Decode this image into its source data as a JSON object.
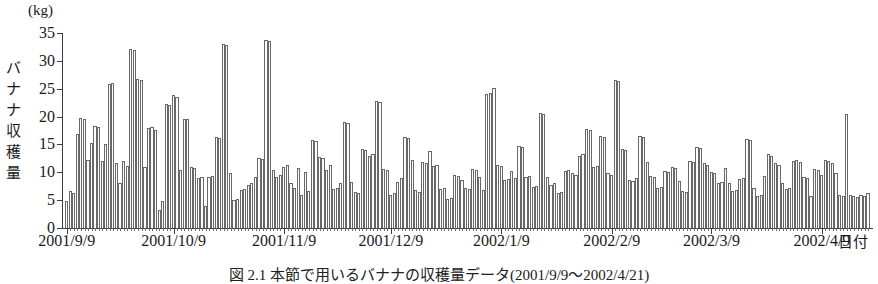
{
  "figure": {
    "unit_label": "(kg)",
    "y_axis_title_chars": [
      "バ",
      "ナ",
      "ナ",
      "収",
      "穫",
      "量"
    ],
    "x_axis_title": "日付",
    "caption": "図 2.1  本節で用いるバナナの収穫量データ(2001/9/9〜2002/4/21)"
  },
  "chart_data": {
    "type": "bar",
    "title": "",
    "xlabel": "日付",
    "ylabel": "バナナ収穫量",
    "unit": "kg",
    "ylim": [
      0,
      35
    ],
    "yticks": [
      0,
      5,
      10,
      15,
      20,
      25,
      30,
      35
    ],
    "grid": false,
    "legend": null,
    "x_tick_labels": [
      "2001/9/9",
      "2001/10/9",
      "2001/11/9",
      "2001/12/9",
      "2002/1/9",
      "2002/2/9",
      "2002/3/9",
      "2002/4/9"
    ],
    "x_tick_indices": [
      0,
      30,
      61,
      91,
      122,
      153,
      181,
      212
    ],
    "n_points": 226,
    "start_date": "2001/9/9",
    "values": [
      4.8,
      6.6,
      6.2,
      16.8,
      19.8,
      19.6,
      12.2,
      15.2,
      18.4,
      18.2,
      12.0,
      15.0,
      25.8,
      26.0,
      11.6,
      8.0,
      12.0,
      11.2,
      32.2,
      32.0,
      26.8,
      26.6,
      11.0,
      18.0,
      18.2,
      17.6,
      3.2,
      4.8,
      22.2,
      22.0,
      23.8,
      23.6,
      10.4,
      19.6,
      19.6,
      11.0,
      10.8,
      9.0,
      9.2,
      4.0,
      9.2,
      9.4,
      16.4,
      16.2,
      33.0,
      32.8,
      9.8,
      5.0,
      5.2,
      6.8,
      7.0,
      7.8,
      8.0,
      9.2,
      12.6,
      12.4,
      33.8,
      33.6,
      10.4,
      9.2,
      9.6,
      11.0,
      11.4,
      8.0,
      7.2,
      10.8,
      6.0,
      10.0,
      6.6,
      15.8,
      15.6,
      12.8,
      12.6,
      10.4,
      11.4,
      7.0,
      7.2,
      8.0,
      19.0,
      18.8,
      8.2,
      6.4,
      6.2,
      14.2,
      14.0,
      13.0,
      13.2,
      22.8,
      22.6,
      10.6,
      10.4,
      6.0,
      6.2,
      8.2,
      9.0,
      16.4,
      16.2,
      12.2,
      6.8,
      6.4,
      11.8,
      11.6,
      13.8,
      11.2,
      11.4,
      7.0,
      7.2,
      5.2,
      5.4,
      9.6,
      9.4,
      8.6,
      7.2,
      7.0,
      10.6,
      10.4,
      9.2,
      6.8,
      24.0,
      24.2,
      25.2,
      11.4,
      11.2,
      8.6,
      8.8,
      10.2,
      9.0,
      14.8,
      14.6,
      9.2,
      9.4,
      7.4,
      7.6,
      20.6,
      20.4,
      9.2,
      7.8,
      8.0,
      6.2,
      6.4,
      10.2,
      10.4,
      9.8,
      9.6,
      13.0,
      13.2,
      17.8,
      17.6,
      11.0,
      11.2,
      16.6,
      16.4,
      9.8,
      9.6,
      26.6,
      26.4,
      14.2,
      14.0,
      8.6,
      8.4,
      9.0,
      16.6,
      16.4,
      11.8,
      9.4,
      9.2,
      7.2,
      7.4,
      10.2,
      10.0,
      11.0,
      10.8,
      8.4,
      6.6,
      6.4,
      12.0,
      11.8,
      14.6,
      14.4,
      11.6,
      11.4,
      10.0,
      9.8,
      8.0,
      8.2,
      10.8,
      8.0,
      6.6,
      6.8,
      8.8,
      9.0,
      16.0,
      15.8,
      7.2,
      5.8,
      6.0,
      9.4,
      13.2,
      13.0,
      11.6,
      11.4,
      8.0,
      7.0,
      7.2,
      12.0,
      12.2,
      11.8,
      9.2,
      9.0,
      5.8,
      10.6,
      10.4,
      9.6,
      12.2,
      12.0,
      11.6,
      9.8,
      6.0,
      5.8,
      20.5,
      6.0,
      5.8,
      5.6,
      6.0,
      5.8,
      6.2
    ]
  }
}
